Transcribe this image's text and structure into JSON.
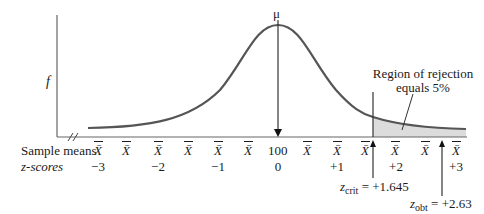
{
  "diagram": {
    "y_axis_label": "f",
    "mean_label": "μ",
    "rejection_label_line1": "Region of rejection",
    "rejection_label_line2": "equals 5%",
    "row_labels": {
      "sample_means": "Sample means",
      "z_scores": "z-scores"
    },
    "sample_means": [
      "X̄",
      "X̄",
      "X̄",
      "X̄",
      "X̄",
      "X̄",
      "100",
      "X̄",
      "X̄",
      "X̄",
      "X̄",
      "X̄",
      "X̄"
    ],
    "z_scores": [
      "−3",
      "−2",
      "−1",
      "0",
      "+1",
      "+2",
      "+3"
    ],
    "z_crit": {
      "symbol": "z",
      "sub": "crit",
      "value": "= +1.645"
    },
    "z_obt": {
      "symbol": "z",
      "sub": "obt",
      "value": "= +2.63"
    },
    "colors": {
      "curve": "#555555",
      "axis": "#666666",
      "shade": "#dcdcdc",
      "text": "#1a1a1a"
    }
  }
}
